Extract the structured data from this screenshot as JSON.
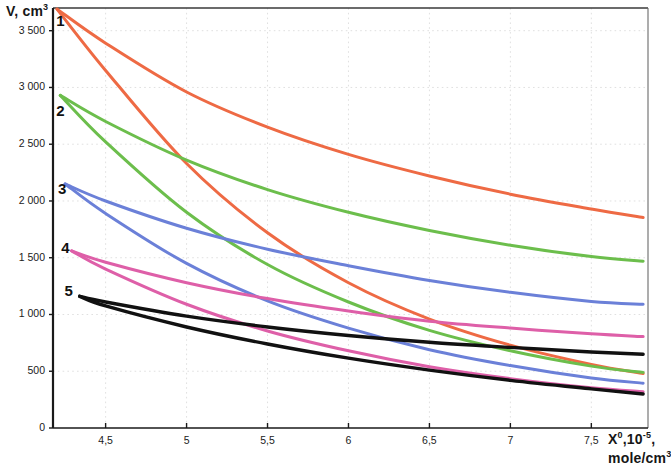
{
  "chart_data": {
    "type": "line",
    "title": "",
    "xlabel": "X⁰,10⁻⁵, mole/cm³",
    "ylabel": "V, cm³",
    "xlabel_main": "X",
    "xlabel_sup1": "0",
    "xlabel_mid": ",10",
    "xlabel_sup2": "-5",
    "xlabel_tail": ",",
    "xlabel_line2": "mole/cm",
    "xlabel_line2_sup": "3",
    "ylabel_main": "V, cm",
    "ylabel_sup": "3",
    "xlim": [
      4.175,
      7.85
    ],
    "ylim": [
      0,
      3700
    ],
    "grid": true,
    "legend_position": "inline-curve-labels",
    "y_ticks": [
      0,
      500,
      1000,
      1500,
      2000,
      2500,
      3000,
      3500
    ],
    "y_tick_labels": [
      "0",
      "500",
      "1 000",
      "1 500",
      "2 000",
      "2 500",
      "3 000",
      "3 500"
    ],
    "x_ticks": [
      4.5,
      5,
      5.5,
      6,
      6.5,
      7,
      7.5
    ],
    "x_tick_labels": [
      "4,5",
      "5",
      "5,5",
      "6",
      "6,5",
      "7",
      "7,5"
    ],
    "curve_labels": [
      {
        "text": "1",
        "x": 4.22,
        "y": 3580,
        "color": "#111111"
      },
      {
        "text": "2",
        "x": 4.22,
        "y": 2780,
        "color": "#111111"
      },
      {
        "text": "3",
        "x": 4.23,
        "y": 2100,
        "color": "#111111"
      },
      {
        "text": "4",
        "x": 4.25,
        "y": 1580,
        "color": "#111111"
      },
      {
        "text": "5",
        "x": 4.27,
        "y": 1195,
        "color": "#111111"
      }
    ],
    "colors": {
      "orange": "#EE6A44",
      "green": "#6CBE4C",
      "blue": "#6B80D8",
      "pink": "#DE5FA8",
      "black": "#111111",
      "grid": "#DCDCDC",
      "axis": "#1a1a1a"
    },
    "series": [
      {
        "name": "1 upper (orange)",
        "group": "1",
        "color": "#EE6A44",
        "x": [
          4.2,
          4.5,
          5.0,
          5.5,
          6.0,
          6.5,
          7.0,
          7.5,
          7.82
        ],
        "values": [
          3690,
          3390,
          2960,
          2650,
          2410,
          2220,
          2060,
          1930,
          1855
        ]
      },
      {
        "name": "1 lower (orange)",
        "group": "1",
        "color": "#EE6A44",
        "x": [
          4.2,
          4.5,
          5.0,
          5.5,
          6.0,
          6.5,
          7.0,
          7.5,
          7.82
        ],
        "values": [
          3690,
          3150,
          2330,
          1720,
          1280,
          960,
          730,
          560,
          480
        ]
      },
      {
        "name": "2 upper (green)",
        "group": "2",
        "color": "#6CBE4C",
        "x": [
          4.22,
          4.5,
          5.0,
          5.5,
          6.0,
          6.5,
          7.0,
          7.5,
          7.82
        ],
        "values": [
          2930,
          2700,
          2360,
          2100,
          1900,
          1740,
          1610,
          1510,
          1470
        ]
      },
      {
        "name": "2 lower (green)",
        "group": "2",
        "color": "#6CBE4C",
        "x": [
          4.22,
          4.5,
          5.0,
          5.5,
          6.0,
          6.5,
          7.0,
          7.5,
          7.82
        ],
        "values": [
          2930,
          2520,
          1900,
          1440,
          1110,
          860,
          680,
          545,
          490
        ]
      },
      {
        "name": "3 upper (blue)",
        "group": "3",
        "color": "#6B80D8",
        "x": [
          4.25,
          4.5,
          5.0,
          5.5,
          6.0,
          6.5,
          7.0,
          7.5,
          7.82
        ],
        "values": [
          2150,
          2000,
          1760,
          1575,
          1430,
          1300,
          1195,
          1115,
          1090
        ]
      },
      {
        "name": "3 lower (blue)",
        "group": "3",
        "color": "#6B80D8",
        "x": [
          4.25,
          4.5,
          5.0,
          5.5,
          6.0,
          6.5,
          7.0,
          7.5,
          7.82
        ],
        "values": [
          2150,
          1890,
          1450,
          1120,
          880,
          690,
          550,
          440,
          395
        ]
      },
      {
        "name": "4 upper (pink)",
        "group": "4",
        "color": "#DE5FA8",
        "x": [
          4.29,
          4.5,
          5.0,
          5.5,
          6.0,
          6.5,
          7.0,
          7.5,
          7.82
        ],
        "values": [
          1560,
          1460,
          1280,
          1140,
          1030,
          940,
          880,
          830,
          805
        ]
      },
      {
        "name": "4 lower (pink)",
        "group": "4",
        "color": "#DE5FA8",
        "x": [
          4.29,
          4.5,
          5.0,
          5.5,
          6.0,
          6.5,
          7.0,
          7.5,
          7.82
        ],
        "values": [
          1560,
          1400,
          1090,
          855,
          680,
          540,
          435,
          355,
          320
        ]
      },
      {
        "name": "5 upper (black)",
        "group": "5",
        "color": "#111111",
        "x": [
          4.34,
          4.5,
          5.0,
          5.5,
          6.0,
          6.5,
          7.0,
          7.5,
          7.82
        ],
        "values": [
          1160,
          1110,
          985,
          890,
          815,
          755,
          710,
          670,
          650
        ]
      },
      {
        "name": "5 lower (black)",
        "group": "5",
        "color": "#111111",
        "x": [
          4.34,
          4.5,
          5.0,
          5.5,
          6.0,
          6.5,
          7.0,
          7.5,
          7.82
        ],
        "values": [
          1160,
          1075,
          890,
          740,
          615,
          510,
          420,
          345,
          300
        ]
      }
    ]
  }
}
